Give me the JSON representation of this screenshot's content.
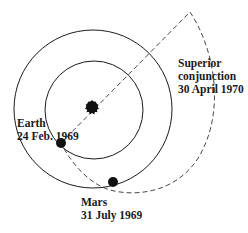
{
  "diagram": {
    "title": "",
    "colors": {
      "line": "#1a1a1a",
      "background": "#ffffff"
    },
    "bodies": {
      "sun": {
        "name": "Sun",
        "cx": 92,
        "cy": 107,
        "r": 7
      },
      "earth_orbit": {
        "cx": 93,
        "cy": 109,
        "r": 79
      },
      "inner_orbit": {
        "cx": 94,
        "cy": 110,
        "r": 49
      }
    },
    "labels": {
      "earth": {
        "line1": "Earth",
        "line2": "24 Feb. 1969"
      },
      "mars": {
        "line1": "Mars",
        "line2": "31 July 1969"
      },
      "conjunction": {
        "line1": "Superior",
        "line2": "conjunction",
        "line3": "30 April 1970"
      }
    },
    "points": {
      "earth_position": {
        "x": 61,
        "y": 143
      },
      "mars_position": {
        "x": 113,
        "y": 182
      },
      "conjunction_point": {
        "x": 190,
        "y": 12
      }
    }
  }
}
